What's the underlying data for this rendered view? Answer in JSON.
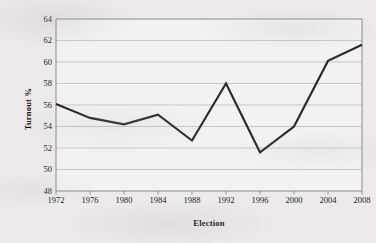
{
  "chart_data": {
    "type": "line",
    "title": "",
    "xlabel": "Election",
    "ylabel": "Turnout %",
    "categories": [
      "1972",
      "1976",
      "1980",
      "1984",
      "1988",
      "1992",
      "1996",
      "2000",
      "2004",
      "2008"
    ],
    "values": [
      56.1,
      54.8,
      54.2,
      55.1,
      52.7,
      58.0,
      51.6,
      54.0,
      60.1,
      61.6
    ],
    "series": [
      {
        "name": "Turnout %",
        "values": [
          56.1,
          54.8,
          54.2,
          55.1,
          52.7,
          58.0,
          51.6,
          54.0,
          60.1,
          61.6
        ]
      }
    ],
    "ylim": [
      48,
      64
    ],
    "yticks": [
      48,
      50,
      52,
      54,
      56,
      58,
      60,
      62,
      64
    ],
    "ytick_labels": [
      "48",
      "50",
      "52",
      "54",
      "56",
      "58",
      "60",
      "62",
      "64"
    ],
    "xtick_labels": [
      "1972",
      "1976",
      "1980",
      "1984",
      "1988",
      "1992",
      "1996",
      "2000",
      "2004",
      "2008"
    ],
    "grid": "horizontal",
    "legend": "none",
    "line_color": "#2a2a2a",
    "grid_color": "#b4b4b4",
    "axis_color": "#808080",
    "plot_background": "#f6f5f5",
    "page_background": "#eceaea"
  }
}
